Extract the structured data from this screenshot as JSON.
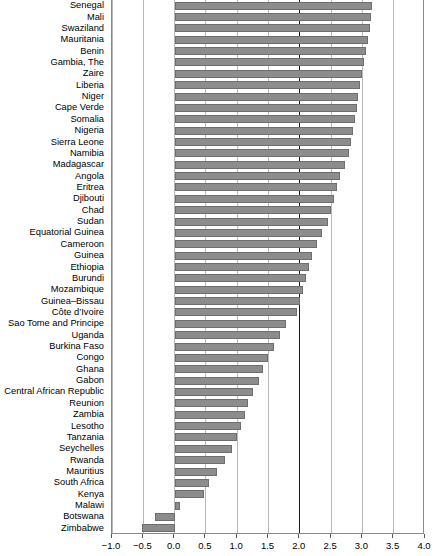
{
  "chart_data": {
    "type": "bar",
    "orientation": "horizontal",
    "title": "",
    "subtitle": "",
    "xlabel": "",
    "ylabel": "",
    "xlim": [
      -1.0,
      4.0
    ],
    "grid": true,
    "legend": null,
    "axis": {
      "tick_values": [
        -1.0,
        -0.5,
        0.0,
        0.5,
        1.0,
        1.5,
        2.0,
        2.5,
        3.0,
        3.5,
        4.0
      ],
      "tick_labels": [
        "-1.0",
        "-0.5",
        "0.0",
        "0.5",
        "1.0",
        "1.5",
        "2.0",
        "2.5",
        "3.0",
        "3.5",
        "4.0"
      ],
      "reference_line": 2.0,
      "zero_line": 0.0
    },
    "colors": {
      "bar_fill": "#8c8c8c",
      "bar_stroke": "#6e6e6e",
      "gridline": "#b9b9b9",
      "reference_line": "#1a1a1a",
      "axis": "#8a8a8a",
      "text": "#000000",
      "background": "#ffffff"
    },
    "categories": [
      "Senegal",
      "Mali",
      "Swaziland",
      "Mauritania",
      "Benin",
      "Gambia, The",
      "Zaire",
      "Liberia",
      "Niger",
      "Cape Verde",
      "Somalia",
      "Nigeria",
      "Sierra Leone",
      "Namibia",
      "Madagascar",
      "Angola",
      "Eritrea",
      "Djibouti",
      "Chad",
      "Sudan",
      "Equatorial Guinea",
      "Cameroon",
      "Guinea",
      "Ethiopia",
      "Burundi",
      "Mozambique",
      "Guinea–Bissau",
      "Côte d’Ivoire",
      "Sao Tome and Principe",
      "Uganda",
      "Burkina Faso",
      "Congo",
      "Ghana",
      "Gabon",
      "Central African Republic",
      "Reunion",
      "Zambia",
      "Lesotho",
      "Tanzania",
      "Seychelles",
      "Rwanda",
      "Mauritius",
      "South Africa",
      "Kenya",
      "Malawi",
      "Botswana",
      "Zimbabwe"
    ],
    "values": [
      3.16,
      3.14,
      3.12,
      3.09,
      3.05,
      3.03,
      2.99,
      2.96,
      2.93,
      2.91,
      2.88,
      2.85,
      2.82,
      2.79,
      2.72,
      2.65,
      2.6,
      2.55,
      2.5,
      2.45,
      2.35,
      2.28,
      2.2,
      2.15,
      2.1,
      2.05,
      2.0,
      1.95,
      1.78,
      1.68,
      1.58,
      1.5,
      1.42,
      1.35,
      1.25,
      1.18,
      1.12,
      1.06,
      1.0,
      0.92,
      0.8,
      0.68,
      0.55,
      0.47,
      0.08,
      -0.32,
      -0.52
    ]
  }
}
